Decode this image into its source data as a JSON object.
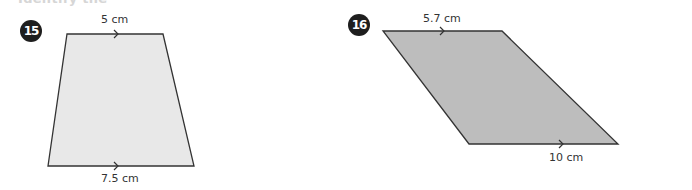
{
  "header": {
    "cut_off_title": "Identify the"
  },
  "problems": [
    {
      "number": "15",
      "shape": "trapezoid",
      "fill": "#e8e8e8",
      "top_label": "5 cm",
      "bottom_label": "7.5 cm"
    },
    {
      "number": "16",
      "shape": "parallelogram-trapezoid",
      "fill": "#bdbdbd",
      "top_label": "5.7 cm",
      "bottom_label": "10 cm"
    }
  ]
}
